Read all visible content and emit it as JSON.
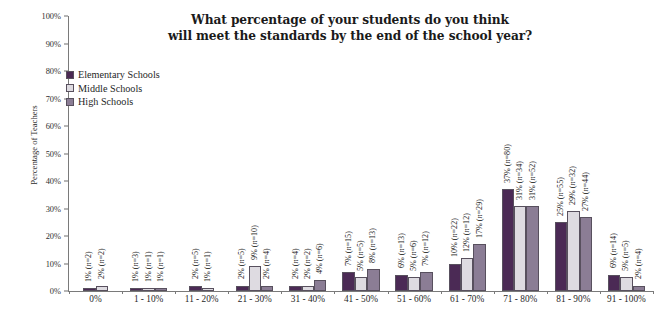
{
  "chart_data": {
    "type": "bar",
    "title": "What percentage of your students do you think will meet the standards by the end of the school year?",
    "title_lines": [
      "What percentage of your students do you think",
      "will meet the standards by the end of the school year?"
    ],
    "xlabel": "",
    "ylabel": "Percentage of Teachers",
    "ylim": [
      0,
      100
    ],
    "ytick_labels": [
      "0%",
      "10%",
      "20%",
      "30%",
      "40%",
      "50%",
      "60%",
      "70%",
      "80%",
      "90%",
      "100%"
    ],
    "ytick_values": [
      0,
      10,
      20,
      30,
      40,
      50,
      60,
      70,
      80,
      90,
      100
    ],
    "grid": false,
    "legend_position": "upper-left-inside",
    "categories": [
      "0%",
      "1 - 10%",
      "11 - 20%",
      "21 - 30%",
      "31 - 40%",
      "41 - 50%",
      "51 - 60%",
      "61 - 70%",
      "71 - 80%",
      "81 - 90%",
      "91 - 100%"
    ],
    "series": [
      {
        "name": "Elementary Schools",
        "color": "#4b2a55",
        "values": [
          1,
          1,
          2,
          2,
          2,
          7,
          6,
          10,
          37,
          25,
          6
        ],
        "n": [
          2,
          3,
          5,
          5,
          4,
          15,
          13,
          22,
          80,
          55,
          14
        ],
        "labels": [
          "1% (n=2)",
          "1% (n=3)",
          "2% (n=5)",
          "2% (n=5)",
          "2% (n=4)",
          "7% (n=15)",
          "6% (n=13)",
          "10% (n=22)",
          "37% (n=80)",
          "25% (n=55)",
          "6% (n=14)"
        ]
      },
      {
        "name": "Middle Schools",
        "color": "#dedbe1",
        "values": [
          2,
          1,
          1,
          9,
          2,
          5,
          5,
          12,
          31,
          29,
          5
        ],
        "n": [
          2,
          1,
          1,
          10,
          2,
          5,
          6,
          12,
          34,
          32,
          5
        ],
        "labels": [
          "2% (n=2)",
          "1% (n=1)",
          "1% (n=1)",
          "9% (n=10)",
          "2% (n=2)",
          "5% (n=5)",
          "5% (n=6)",
          "12% (n=12)",
          "31% (n=34)",
          "29% (n=32)",
          "5% (n=5)"
        ]
      },
      {
        "name": "High Schools",
        "color": "#8b7d95",
        "values": [
          null,
          1,
          null,
          2,
          4,
          8,
          7,
          17,
          31,
          27,
          2
        ],
        "n": [
          null,
          1,
          null,
          4,
          6,
          13,
          12,
          29,
          52,
          44,
          4
        ],
        "labels": [
          null,
          "1% (n=1)",
          null,
          "2% (n=4)",
          "4% (n=6)",
          "8% (n=13)",
          "7% (n=12)",
          "17% (n=29)",
          "31% (n=52)",
          "27% (n=44)",
          "2% (n=4)"
        ]
      }
    ]
  },
  "legend": {
    "items": [
      {
        "label": "Elementary Schools",
        "color": "#4b2a55"
      },
      {
        "label": "Middle Schools",
        "color": "#dedbe1"
      },
      {
        "label": "High Schools",
        "color": "#8b7d95"
      }
    ]
  }
}
